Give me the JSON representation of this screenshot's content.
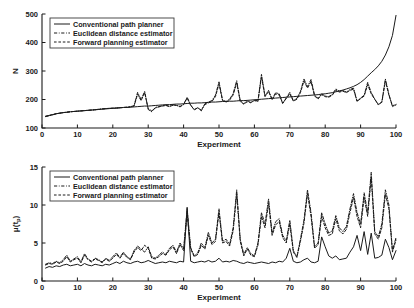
{
  "figure": {
    "title": "",
    "panel_count": 2
  },
  "legend": {
    "entries": [
      {
        "label": "Conventional path planner",
        "style": "solid"
      },
      {
        "label": "Euclidean distance estimator",
        "style": "dash-dot"
      },
      {
        "label": "Forward planning estimator",
        "style": "dashed"
      }
    ]
  },
  "chart_data": [
    {
      "type": "line",
      "title": "",
      "xlabel": "Experiment",
      "ylabel": "N",
      "xlim": [
        0,
        100
      ],
      "ylim": [
        100,
        500
      ],
      "xticks": [
        0,
        10,
        20,
        30,
        40,
        50,
        60,
        70,
        80,
        90,
        100
      ],
      "yticks": [
        100,
        200,
        300,
        400,
        500
      ],
      "grid": false,
      "legend_position": "top-left",
      "x": [
        1,
        2,
        3,
        4,
        5,
        6,
        7,
        8,
        9,
        10,
        11,
        12,
        13,
        14,
        15,
        16,
        17,
        18,
        19,
        20,
        21,
        22,
        23,
        24,
        25,
        26,
        27,
        28,
        29,
        30,
        31,
        32,
        33,
        34,
        35,
        36,
        37,
        38,
        39,
        40,
        41,
        42,
        43,
        44,
        45,
        46,
        47,
        48,
        49,
        50,
        51,
        52,
        53,
        54,
        55,
        56,
        57,
        58,
        59,
        60,
        61,
        62,
        63,
        64,
        65,
        66,
        67,
        68,
        69,
        70,
        71,
        72,
        73,
        74,
        75,
        76,
        77,
        78,
        79,
        80,
        81,
        82,
        83,
        84,
        85,
        86,
        87,
        88,
        89,
        90,
        91,
        92,
        93,
        94,
        95,
        96,
        97,
        98,
        99,
        100
      ],
      "series": [
        {
          "name": "Conventional path planner",
          "style": "solid",
          "values": [
            141,
            144,
            147,
            150,
            152,
            154,
            155,
            157,
            158,
            159,
            160,
            161,
            162,
            163,
            164,
            165,
            166,
            167,
            168,
            169,
            170,
            171,
            172,
            172,
            173,
            174,
            175,
            176,
            177,
            177,
            178,
            179,
            180,
            181,
            182,
            182,
            183,
            184,
            184,
            185,
            186,
            187,
            187,
            188,
            188,
            189,
            190,
            191,
            191,
            192,
            193,
            193,
            194,
            194,
            195,
            196,
            196,
            197,
            198,
            199,
            200,
            201,
            202,
            203,
            204,
            205,
            206,
            207,
            208,
            209,
            210,
            211,
            212,
            213,
            214,
            215,
            216,
            217,
            219,
            220,
            222,
            224,
            227,
            230,
            233,
            237,
            241,
            246,
            252,
            260,
            270,
            282,
            294,
            305,
            318,
            334,
            356,
            385,
            425,
            495
          ]
        },
        {
          "name": "Euclidean distance estimator",
          "style": "dash-dot",
          "values": [
            140,
            143,
            146,
            150,
            152,
            154,
            155,
            157,
            158,
            159,
            160,
            161,
            162,
            163,
            164,
            166,
            167,
            168,
            169,
            169,
            170,
            171,
            172,
            173,
            175,
            178,
            225,
            200,
            228,
            165,
            157,
            172,
            175,
            178,
            180,
            176,
            181,
            180,
            174,
            183,
            208,
            181,
            163,
            172,
            160,
            185,
            191,
            196,
            215,
            262,
            198,
            193,
            201,
            221,
            266,
            196,
            185,
            196,
            188,
            198,
            195,
            288,
            213,
            232,
            201,
            224,
            220,
            185,
            206,
            225,
            196,
            204,
            228,
            272,
            245,
            270,
            215,
            204,
            220,
            212,
            210,
            218,
            237,
            229,
            232,
            226,
            235,
            240,
            195,
            205,
            215,
            260,
            224,
            202,
            181,
            192,
            272,
            218,
            175,
            181
          ]
        },
        {
          "name": "Forward planning estimator",
          "style": "dashed",
          "values": [
            141,
            144,
            147,
            150,
            152,
            154,
            156,
            157,
            158,
            159,
            160,
            161,
            162,
            163,
            164,
            165,
            167,
            168,
            169,
            170,
            170,
            171,
            172,
            173,
            174,
            177,
            218,
            196,
            224,
            168,
            160,
            170,
            174,
            177,
            179,
            175,
            180,
            179,
            176,
            182,
            205,
            179,
            165,
            170,
            163,
            182,
            188,
            193,
            210,
            255,
            196,
            191,
            198,
            216,
            258,
            193,
            184,
            192,
            190,
            196,
            193,
            280,
            210,
            228,
            199,
            220,
            216,
            188,
            203,
            220,
            194,
            201,
            224,
            265,
            240,
            263,
            212,
            202,
            217,
            210,
            208,
            215,
            232,
            226,
            229,
            224,
            232,
            236,
            193,
            203,
            212,
            252,
            220,
            200,
            183,
            190,
            265,
            215,
            178,
            183
          ]
        }
      ]
    },
    {
      "type": "line",
      "title": "",
      "xlabel": "Experiment",
      "ylabel": "μ(t_p)",
      "xlim": [
        0,
        100
      ],
      "ylim": [
        0,
        15
      ],
      "xticks": [
        0,
        10,
        20,
        30,
        40,
        50,
        60,
        70,
        80,
        90,
        100
      ],
      "yticks": [
        0,
        5,
        10,
        15
      ],
      "grid": false,
      "legend_position": "top-left",
      "x": [
        1,
        2,
        3,
        4,
        5,
        6,
        7,
        8,
        9,
        10,
        11,
        12,
        13,
        14,
        15,
        16,
        17,
        18,
        19,
        20,
        21,
        22,
        23,
        24,
        25,
        26,
        27,
        28,
        29,
        30,
        31,
        32,
        33,
        34,
        35,
        36,
        37,
        38,
        39,
        40,
        41,
        42,
        43,
        44,
        45,
        46,
        47,
        48,
        49,
        50,
        51,
        52,
        53,
        54,
        55,
        56,
        57,
        58,
        59,
        60,
        61,
        62,
        63,
        64,
        65,
        66,
        67,
        68,
        69,
        70,
        71,
        72,
        73,
        74,
        75,
        76,
        77,
        78,
        79,
        80,
        81,
        82,
        83,
        84,
        85,
        86,
        87,
        88,
        89,
        90,
        91,
        92,
        93,
        94,
        95,
        96,
        97,
        98,
        99,
        100
      ],
      "series": [
        {
          "name": "Conventional path planner",
          "style": "solid",
          "values": [
            1.7,
            1.9,
            1.8,
            2.0,
            1.9,
            2.1,
            2.2,
            2.0,
            2.1,
            2.2,
            2.0,
            2.3,
            2.1,
            2.0,
            2.2,
            2.1,
            2.0,
            2.2,
            2.1,
            2.3,
            2.5,
            2.3,
            2.6,
            2.4,
            2.3,
            2.5,
            2.6,
            2.4,
            2.5,
            2.7,
            2.5,
            2.3,
            2.4,
            2.5,
            2.4,
            2.6,
            2.5,
            2.4,
            2.6,
            2.5,
            9.7,
            2.6,
            2.4,
            2.5,
            2.6,
            2.5,
            2.7,
            2.5,
            2.6,
            3.0,
            2.5,
            2.6,
            2.5,
            2.7,
            2.6,
            2.4,
            2.3,
            2.5,
            2.4,
            2.3,
            2.4,
            2.5,
            2.4,
            2.3,
            2.5,
            2.4,
            2.6,
            2.5,
            3.0,
            4.3,
            2.6,
            2.4,
            2.5,
            2.8,
            3.0,
            2.5,
            2.4,
            2.6,
            5.8,
            4.5,
            3.3,
            3.0,
            3.3,
            2.8,
            2.9,
            3.0,
            3.8,
            4.5,
            6.0,
            4.0,
            6.5,
            3.5,
            6.3,
            3.0,
            3.1,
            3.4,
            5.5,
            4.4,
            2.8,
            4.0
          ]
        },
        {
          "name": "Euclidean distance estimator",
          "style": "dash-dot",
          "values": [
            2.2,
            2.4,
            2.3,
            2.6,
            2.4,
            2.8,
            3.4,
            2.6,
            2.9,
            3.2,
            2.5,
            3.6,
            2.9,
            2.6,
            3.0,
            2.8,
            2.5,
            3.0,
            2.7,
            3.2,
            3.7,
            3.1,
            3.8,
            3.2,
            2.9,
            4.0,
            4.6,
            4.2,
            3.8,
            4.5,
            3.2,
            3.0,
            3.4,
            3.8,
            3.5,
            4.3,
            4.7,
            3.8,
            5.0,
            4.2,
            9.5,
            4.4,
            3.3,
            3.7,
            5.0,
            4.4,
            6.4,
            5.0,
            5.5,
            9.5,
            5.2,
            5.5,
            4.8,
            7.0,
            12.0,
            5.5,
            3.5,
            4.4,
            3.6,
            3.3,
            5.0,
            9.0,
            7.5,
            10.8,
            6.3,
            7.8,
            8.2,
            6.0,
            5.3,
            8.0,
            4.0,
            3.2,
            5.5,
            8.0,
            12.0,
            9.0,
            4.5,
            5.0,
            9.0,
            7.5,
            6.3,
            6.6,
            8.6,
            7.0,
            6.5,
            7.2,
            9.5,
            11.5,
            9.0,
            7.5,
            11.6,
            9.0,
            14.3,
            6.5,
            5.8,
            7.5,
            12.0,
            10.0,
            4.0,
            5.7
          ]
        },
        {
          "name": "Forward planning estimator",
          "style": "dashed",
          "values": [
            2.1,
            2.3,
            2.2,
            2.5,
            2.3,
            2.6,
            3.2,
            2.5,
            2.8,
            3.0,
            2.4,
            3.4,
            2.8,
            2.5,
            2.9,
            2.7,
            2.4,
            2.9,
            2.6,
            3.0,
            3.5,
            3.0,
            3.6,
            3.1,
            2.8,
            3.8,
            4.4,
            4.0,
            4.7,
            4.3,
            3.0,
            2.9,
            3.2,
            3.6,
            3.4,
            4.1,
            4.5,
            3.6,
            4.8,
            4.0,
            8.8,
            4.2,
            3.2,
            3.5,
            4.7,
            4.2,
            6.0,
            4.8,
            5.2,
            9.0,
            5.0,
            5.2,
            4.6,
            6.6,
            11.4,
            5.2,
            3.3,
            4.2,
            3.4,
            3.2,
            4.7,
            8.5,
            7.0,
            10.2,
            6.0,
            7.4,
            7.8,
            5.7,
            5.0,
            7.5,
            3.8,
            3.1,
            5.2,
            7.6,
            11.5,
            8.5,
            4.3,
            4.8,
            8.5,
            7.0,
            6.0,
            6.2,
            8.2,
            6.6,
            6.2,
            6.8,
            9.0,
            11.0,
            8.5,
            7.0,
            11.0,
            8.5,
            13.6,
            6.2,
            5.5,
            7.0,
            11.4,
            9.5,
            3.8,
            5.4
          ]
        }
      ]
    }
  ]
}
